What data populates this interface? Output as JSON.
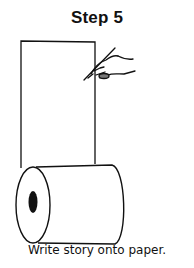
{
  "title": "Step 5",
  "caption": "Write story onto paper.",
  "illustration": {
    "elements": [
      "paper-sheet",
      "paper-roll",
      "hand-holding-pen"
    ],
    "colors": {
      "ink": "#111111",
      "background": "#ffffff"
    }
  }
}
